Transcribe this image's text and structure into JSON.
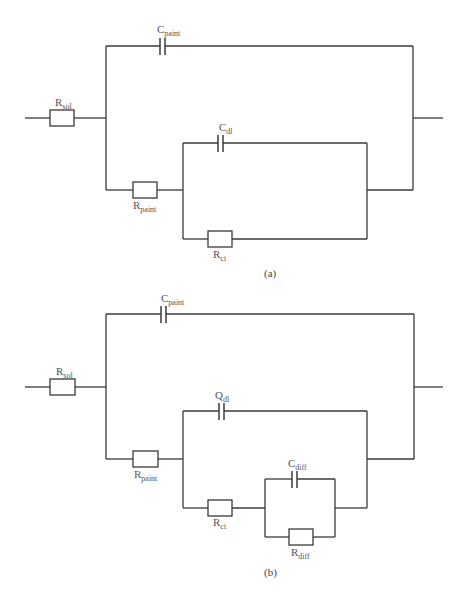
{
  "diagram_a": {
    "caption": "(a)",
    "components": {
      "r_sol": {
        "main": "R",
        "sub": "sol"
      },
      "c_paint": {
        "main": "C",
        "sub": "paint"
      },
      "r_paint": {
        "main": "R",
        "sub": "paint"
      },
      "c_dl": {
        "main": "C",
        "sub": "dl"
      },
      "r_ct": {
        "main": "R",
        "sub": "ct"
      }
    }
  },
  "diagram_b": {
    "caption": "(b)",
    "components": {
      "r_sol": {
        "main": "R",
        "sub": "sol"
      },
      "c_paint": {
        "main": "C",
        "sub": "paint"
      },
      "r_paint": {
        "main": "R",
        "sub": "paint"
      },
      "q_dl": {
        "main": "Q",
        "sub": "dl"
      },
      "r_ct": {
        "main": "R",
        "sub": "ct"
      },
      "c_diff": {
        "main": "C",
        "sub": "diff"
      },
      "r_diff": {
        "main": "R",
        "sub": "diff"
      }
    }
  },
  "colors": {
    "wire": "#3a3a3a",
    "label": "#555555",
    "background": "#ffffff"
  }
}
